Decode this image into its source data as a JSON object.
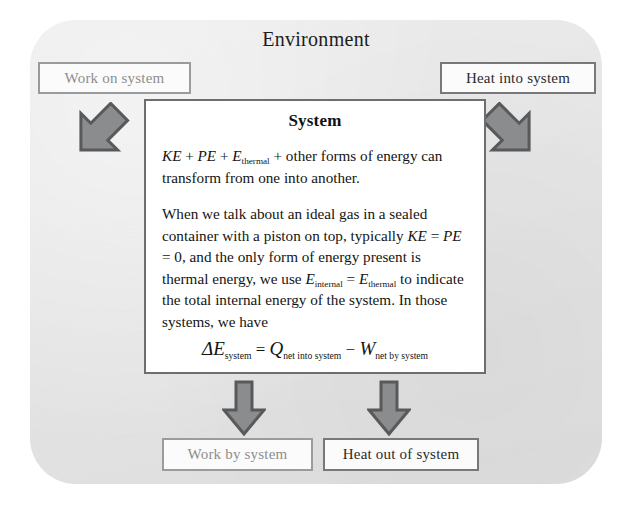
{
  "diagram": {
    "environment_label": "Environment",
    "system_label": "System"
  },
  "inputs": [
    {
      "id": "work-on-system",
      "label": "Work on system",
      "style": "faint"
    },
    {
      "id": "heat-into-system",
      "label": "Heat into system",
      "style": "normal"
    }
  ],
  "outputs": [
    {
      "id": "work-by-system",
      "label": "Work by system",
      "style": "faint"
    },
    {
      "id": "heat-out-of-system",
      "label": "Heat out of system",
      "style": "normal"
    }
  ],
  "system_text": {
    "para1_a": "KE",
    "para1_b": " + ",
    "para1_c": "PE",
    "para1_d": " + ",
    "para1_e": "E",
    "para1_sub": "thermal",
    "para1_f": " + other forms of energy can transform from one into another.",
    "para2_a": "When we talk about an ideal gas in a sealed container with a piston on top, typically ",
    "para2_b": "KE",
    "para2_c": " = ",
    "para2_d": "PE",
    "para2_e": " = 0, and the only form of energy present is thermal energy, we use ",
    "para2_f": "E",
    "para2_sub1": "internal",
    "para2_g": " = ",
    "para2_h": "E",
    "para2_sub2": "thermal",
    "para2_i": " to indicate the total internal energy of the system. In those systems, we have"
  },
  "equation": {
    "delta": "Δ",
    "e_symbol": "E",
    "e_sub": "system",
    "equals": " = ",
    "q_symbol": "Q",
    "q_sub": "net into system",
    "minus": " − ",
    "w_symbol": "W",
    "w_sub": "net by system"
  },
  "colors": {
    "panel_background": "#e3e3e3",
    "system_background": "#ffffff",
    "box_border": "#77787a",
    "arrow_fill": "#8b8c8e",
    "arrow_stroke": "#58595b",
    "text": "#141414",
    "faint_text": "#8d8d8d"
  },
  "arrows": [
    {
      "id": "arrow-work-into-system",
      "direction": "down-right"
    },
    {
      "id": "arrow-heat-into-system",
      "direction": "down-left"
    },
    {
      "id": "arrow-work-out-of-system",
      "direction": "down"
    },
    {
      "id": "arrow-heat-out-of-system",
      "direction": "down"
    }
  ]
}
